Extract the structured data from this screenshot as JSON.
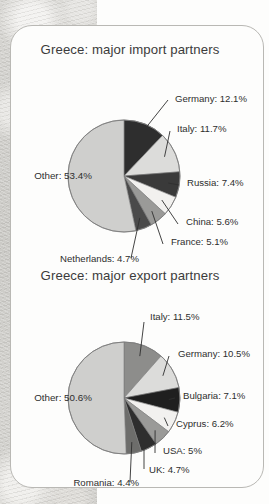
{
  "background": {
    "texture": "mottled-stone-paper",
    "paper_color": "#fdfdfc",
    "card_border_color": "#b9b8b4"
  },
  "charts": [
    {
      "id": "import-partners",
      "title": "Greece: major import partners",
      "chart_data": {
        "type": "pie",
        "title": "Greece: major import partners",
        "xlabel": "",
        "ylabel": "",
        "legend": "none",
        "labels_mode": "leader-line callouts",
        "units": "percent",
        "categories": [
          "Germany",
          "Italy",
          "Russia",
          "China",
          "France",
          "Netherlands",
          "Other"
        ],
        "values": [
          12.1,
          11.7,
          7.4,
          5.6,
          5.1,
          4.7,
          53.4
        ],
        "colors": [
          "#2e2e2e",
          "#dcdcda",
          "#3a3a3a",
          "#f2f1ef",
          "#9a9a98",
          "#4a4a4a",
          "#cfcfcd"
        ],
        "slice_labels": [
          "Germany: 12.1%",
          "Italy: 11.7%",
          "Russia: 7.4%",
          "China: 5.6%",
          "France: 5.1%",
          "Netherlands: 4.7%",
          "Other: 53.4%"
        ],
        "start_angle_deg": 0,
        "direction": "clockwise"
      }
    },
    {
      "id": "export-partners",
      "title": "Greece: major export partners",
      "chart_data": {
        "type": "pie",
        "title": "Greece: major export partners",
        "xlabel": "",
        "ylabel": "",
        "legend": "none",
        "labels_mode": "leader-line callouts",
        "units": "percent",
        "categories": [
          "Italy",
          "Germany",
          "Bulgaria",
          "Cyprus",
          "USA",
          "UK",
          "Romania",
          "Other"
        ],
        "values": [
          11.5,
          10.5,
          7.1,
          6.2,
          5.0,
          4.7,
          4.4,
          50.6
        ],
        "colors": [
          "#8d8d8b",
          "#dcdcda",
          "#1f1f1f",
          "#f2f1ef",
          "#9a9a98",
          "#2e2e2e",
          "#6d6d6b",
          "#cfcfcd"
        ],
        "slice_labels": [
          "Italy: 11.5%",
          "Germany: 10.5%",
          "Bulgaria: 7.1%",
          "Cyprus: 6.2%",
          "USA: 5%",
          "UK: 4.7%",
          "Romania: 4.4%",
          "Other: 50.6%"
        ],
        "start_angle_deg": 0,
        "direction": "clockwise"
      }
    }
  ]
}
